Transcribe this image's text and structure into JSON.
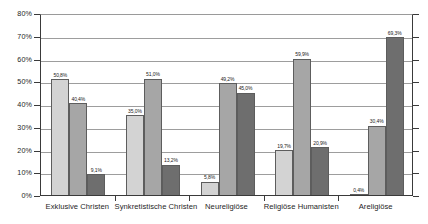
{
  "chart_data": {
    "type": "bar",
    "title": "",
    "subtitle": "",
    "xlabel": "",
    "ylabel": "",
    "ylim": [
      0,
      80
    ],
    "ytick_step": 10,
    "grid": true,
    "legend": "none",
    "orientation": "vertical",
    "grouping": "grouped",
    "categories": [
      "Exklusive Christen",
      "Synkretistische Christen",
      "Neureligiöse",
      "Religiöse Humanisten",
      "Areligiöse"
    ],
    "ytick_labels": [
      "0%",
      "10%",
      "20%",
      "30%",
      "40%",
      "50%",
      "60%",
      "70%",
      "80%"
    ],
    "series": [
      {
        "name": "series-1",
        "color": "#d3d3d3",
        "values": [
          50.8,
          35.0,
          5.8,
          19.7,
          0.4
        ],
        "labels": [
          "50,8%",
          "35,0%",
          "5,8%",
          "19,7%",
          "0,4%"
        ]
      },
      {
        "name": "series-2",
        "color": "#a6a6a6",
        "values": [
          40.4,
          51.0,
          49.2,
          59.9,
          30.4
        ],
        "labels": [
          "40,4%",
          "51,0%",
          "49,2%",
          "59,9%",
          "30,4%"
        ]
      },
      {
        "name": "series-3",
        "color": "#6e6e6e",
        "values": [
          9.1,
          13.2,
          45.0,
          20.9,
          69.3
        ],
        "labels": [
          "9,1%",
          "13,2%",
          "45,0%",
          "20,9%",
          "69,3%"
        ]
      }
    ]
  },
  "style": {
    "axis_color": "#3a3a3a",
    "grid_color": "#9d9d9d",
    "bar_border": "#5d5d5d",
    "text_color": "#1e1e1e",
    "background": "#ffffff"
  }
}
